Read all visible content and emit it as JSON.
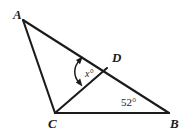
{
  "figure": {
    "type": "geometry-diagram",
    "background_color": "#ffffff",
    "stroke_color": "#1b1b1b",
    "vertices": [
      {
        "name": "A",
        "label": "A",
        "x": 23,
        "y": 20,
        "label_x": 13,
        "label_y": 19
      },
      {
        "name": "B",
        "label": "B",
        "x": 169,
        "y": 113,
        "label_x": 170,
        "label_y": 128
      },
      {
        "name": "C",
        "label": "C",
        "x": 55,
        "y": 113,
        "label_x": 48,
        "label_y": 128
      },
      {
        "name": "D",
        "label": "D",
        "x": 107,
        "y": 68,
        "label_x": 112,
        "label_y": 62
      }
    ],
    "segments": [
      {
        "name": "segment-AB",
        "from": "A",
        "to": "B",
        "x1": 23,
        "y1": 20,
        "x2": 169,
        "y2": 113
      },
      {
        "name": "segment-AC",
        "from": "A",
        "to": "C",
        "x1": 23,
        "y1": 20,
        "x2": 55,
        "y2": 113
      },
      {
        "name": "segment-CB",
        "from": "C",
        "to": "B",
        "x1": 55,
        "y1": 113,
        "x2": 169,
        "y2": 113
      },
      {
        "name": "segment-CD",
        "from": "C",
        "to": "D",
        "x1": 55,
        "y1": 113,
        "x2": 107,
        "y2": 68
      }
    ],
    "angles": [
      {
        "name": "angle-at-D",
        "vertex": "D",
        "label": "x°",
        "value": "x",
        "unit": "degrees",
        "label_x": 85,
        "label_y": 77,
        "marker": "double-headed-arc",
        "between": [
          "DA",
          "DC"
        ]
      },
      {
        "name": "angle-at-B",
        "vertex": "B",
        "label": "52°",
        "value": 52,
        "unit": "degrees",
        "label_x": 121,
        "label_y": 106,
        "marker": "none",
        "between": [
          "BA",
          "BC"
        ]
      }
    ]
  }
}
